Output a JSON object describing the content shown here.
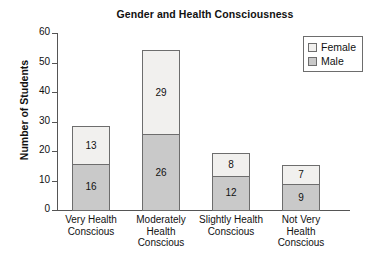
{
  "chart_data": {
    "type": "bar",
    "subtype": "stacked-vertical",
    "title": "Gender and Health Consciousness",
    "xlabel": "",
    "ylabel": "Number of Students",
    "ylim": [
      0,
      60
    ],
    "ytick_step": 10,
    "yticks": [
      "60",
      "50",
      "40",
      "30",
      "20",
      "10",
      "0"
    ],
    "grid": false,
    "legend_position": "top-right",
    "categories": [
      "Very Health Conscious",
      "Moderately Health Conscious",
      "Slightly Health Conscious",
      "Not Very Health Conscious"
    ],
    "category_label_lines": [
      [
        "Very Health",
        "Conscious"
      ],
      [
        "Moderately",
        "Health",
        "Conscious"
      ],
      [
        "Slightly Health",
        "Conscious"
      ],
      [
        "Not Very",
        "Health",
        "Conscious"
      ]
    ],
    "series": [
      {
        "name": "Male",
        "color": "#c9c9c9",
        "values": [
          16,
          26,
          12,
          9
        ]
      },
      {
        "name": "Female",
        "color": "#f1f0ee",
        "values": [
          13,
          29,
          8,
          7
        ]
      }
    ],
    "totals": [
      29,
      55,
      20,
      16
    ],
    "bar_value_labels": {
      "male": [
        "16",
        "26",
        "12",
        "9"
      ],
      "female": [
        "13",
        "29",
        "8",
        "7"
      ]
    }
  },
  "legend": {
    "items": [
      {
        "label": "Female",
        "swatch": "female-swatch"
      },
      {
        "label": "Male",
        "swatch": "male-swatch"
      }
    ]
  },
  "colors": {
    "male_fill": "#c9c9c9",
    "female_fill": "#f1f0ee",
    "outline": "#6d6d6d",
    "axis": "#555555",
    "text": "#111111",
    "background": "#ffffff"
  }
}
